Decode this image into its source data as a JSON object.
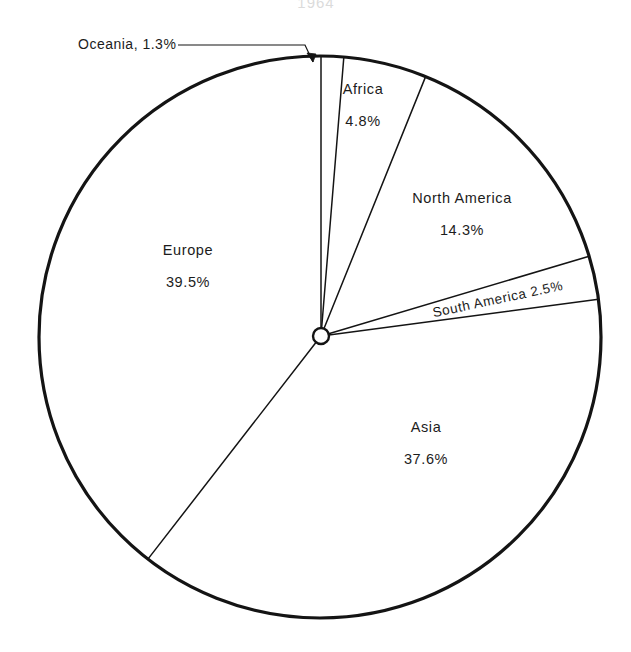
{
  "chart_data": {
    "type": "pie",
    "title": "1964",
    "title_note": "partially cropped at top edge of image",
    "categories": [
      "Oceania",
      "Africa",
      "North America",
      "South America",
      "Asia",
      "Europe"
    ],
    "values": [
      1.3,
      4.8,
      14.3,
      2.5,
      37.6,
      39.5
    ],
    "unit": "%",
    "total": 100.0,
    "start_angle_deg": 0,
    "direction": "clockwise",
    "legend": "none (direct labels)",
    "grid": false,
    "slices": [
      {
        "name": "Oceania",
        "value": 1.3,
        "label_line1": "Oceania, 1.3%",
        "label_line2": "",
        "label_style": "callout",
        "label_x": 78,
        "label_y": 45,
        "rotate": 0
      },
      {
        "name": "Africa",
        "value": 4.8,
        "label_line1": "Africa",
        "label_line2": "4.8%",
        "label_style": "inside",
        "label_x": 363,
        "label_y": 90,
        "rotate": 0
      },
      {
        "name": "North America",
        "value": 14.3,
        "label_line1": "North America",
        "label_line2": "14.3%",
        "label_style": "inside",
        "label_x": 462,
        "label_y": 199,
        "rotate": 0
      },
      {
        "name": "South America",
        "value": 2.5,
        "label_line1": "South America  2.5%",
        "label_line2": "",
        "label_style": "rotated",
        "label_x": 498,
        "label_y": 300,
        "rotate": -12
      },
      {
        "name": "Asia",
        "value": 37.6,
        "label_line1": "Asia",
        "label_line2": "37.6%",
        "label_style": "inside",
        "label_x": 426,
        "label_y": 428,
        "rotate": 0
      },
      {
        "name": "Europe",
        "value": 39.5,
        "label_line1": "Europe",
        "label_line2": "39.5%",
        "label_style": "inside",
        "label_x": 188,
        "label_y": 251,
        "rotate": 0
      }
    ],
    "geometry": {
      "circle_center_x": 320,
      "circle_center_y": 337,
      "circle_radius": 281,
      "hub_center_x": 321,
      "hub_center_y": 336,
      "hub_radius": 8
    },
    "callout": {
      "text": "Oceania, 1.3%",
      "line_from_x": 178,
      "line_from_y": 45,
      "line_to_x": 305,
      "line_to_y": 45,
      "arrow_tip_x": 313,
      "arrow_tip_y": 62
    },
    "colors": {
      "background": "#ffffff",
      "outline": "#141414",
      "divider": "#141414",
      "text": "#1c1c1c",
      "slice_fill": "#ffffff"
    }
  }
}
